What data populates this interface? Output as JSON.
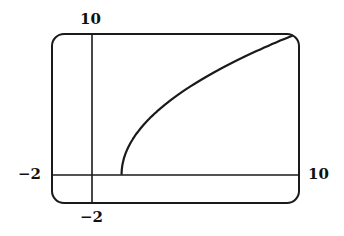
{
  "chart_data": {
    "type": "line",
    "title": "",
    "xlabel": "",
    "ylabel": "",
    "xlim": [
      -2,
      10
    ],
    "ylim": [
      -2,
      10
    ],
    "grid": false,
    "legend": null,
    "series": [
      {
        "name": "curve",
        "x": [
          1.4,
          2.3,
          4.2,
          6.2,
          8.1,
          9.7
        ],
        "y": [
          0.2,
          4.0,
          6.1,
          7.5,
          8.8,
          9.9
        ]
      }
    ],
    "tick_labels": {
      "x_min": "−2",
      "x_max": "10",
      "y_min": "−2",
      "y_max": "10"
    }
  },
  "labels": {
    "top": "10",
    "bottom": "−2",
    "left": "−2",
    "right": "10"
  },
  "colors": {
    "stroke": "#1a1a1a"
  }
}
